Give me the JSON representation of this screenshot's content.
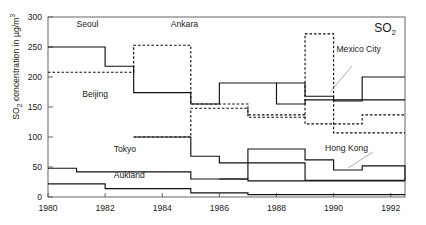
{
  "chart_data": {
    "type": "line",
    "style": "step",
    "title": "SO2",
    "title_main": "SO",
    "title_sub": "2",
    "xlabel": "",
    "ylabel": "SO2 concentration in µg/m³",
    "ylabel_main": "SO",
    "ylabel_sub": "2",
    "ylabel_rest": " concentration in µg/m",
    "ylabel_sup": "3",
    "xlim": [
      1980,
      1992.5
    ],
    "ylim": [
      0,
      300
    ],
    "yticks": [
      0,
      50,
      100,
      150,
      200,
      250,
      300
    ],
    "ytick_labels": [
      "0",
      "50",
      "100",
      "150",
      "200",
      "250",
      "300"
    ],
    "xticks": [
      1980,
      1982,
      1984,
      1986,
      1988,
      1990,
      1992
    ],
    "xtick_labels": [
      "1980",
      "1982",
      "1984",
      "1986",
      "1988",
      "1990",
      "1992"
    ],
    "grid": false,
    "legend": "inline-annotations",
    "series": [
      {
        "name": "Seoul",
        "linestyle": "solid",
        "label_x": 1981.0,
        "label_y": 283,
        "x": [
          1980,
          1982,
          1983,
          1985,
          1986,
          1987,
          1988,
          1989,
          1990,
          1991,
          1992.5
        ],
        "values": [
          250,
          218,
          174,
          155,
          190,
          190,
          155,
          162,
          162,
          162,
          162
        ]
      },
      {
        "name": "Beijing",
        "linestyle": "dashed",
        "label_x": 1981.2,
        "label_y": 166,
        "x": [
          1980,
          1982,
          1983,
          1985,
          1986,
          1987,
          1988,
          1989,
          1990,
          1991,
          1992.5
        ],
        "values": [
          208,
          208,
          253,
          155,
          155,
          137,
          137,
          122,
          122,
          137,
          137
        ]
      },
      {
        "name": "Ankara",
        "linestyle": "dashed",
        "label_x": 1984.3,
        "label_y": 283,
        "x": [
          1983,
          1984,
          1985,
          1986,
          1987,
          1988,
          1989,
          1990,
          1991,
          1992.5
        ],
        "values": [
          100,
          100,
          148,
          148,
          133,
          133,
          272,
          107,
          107,
          107
        ]
      },
      {
        "name": "Mexico City",
        "linestyle": "solid",
        "label_x": 1990.1,
        "label_y": 242,
        "x": [
          1988,
          1989,
          1990,
          1991,
          1992.5
        ],
        "values": [
          190,
          168,
          160,
          200,
          200
        ]
      },
      {
        "name": "Tokyo",
        "linestyle": "solid",
        "label_x": 1982.3,
        "label_y": 75,
        "x": [
          1983,
          1985,
          1986,
          1987,
          1988,
          1989,
          1990,
          1991,
          1992.5
        ],
        "values": [
          100,
          68,
          57,
          57,
          57,
          28,
          28,
          28,
          28
        ]
      },
      {
        "name": "Hong Kong",
        "linestyle": "solid",
        "label_x": 1989.7,
        "label_y": 77,
        "x": [
          1980,
          1981,
          1983,
          1985,
          1987,
          1988,
          1989,
          1990,
          1991,
          1992.5
        ],
        "values": [
          48,
          42,
          42,
          30,
          27,
          27,
          27,
          27,
          27,
          27
        ]
      },
      {
        "name": "Aukland",
        "linestyle": "solid",
        "label_x": 1982.3,
        "label_y": 31,
        "x": [
          1980,
          1981,
          1982,
          1984,
          1985,
          1986,
          1987,
          1989,
          1992.5
        ],
        "values": [
          22,
          22,
          14,
          14,
          7,
          7,
          4,
          4,
          4
        ]
      },
      {
        "name": "Hong Kong upper",
        "linestyle": "solid",
        "label_x": null,
        "label_y": null,
        "x": [
          1986,
          1987,
          1988,
          1989,
          1990,
          1991,
          1992.5
        ],
        "values": [
          30,
          80,
          80,
          62,
          45,
          52,
          27
        ]
      }
    ],
    "annotations": [
      {
        "text": "Seoul",
        "x": 1981.0,
        "y": 283
      },
      {
        "text": "Ankara",
        "x": 1984.3,
        "y": 283
      },
      {
        "text": "Beijing",
        "x": 1981.2,
        "y": 166
      },
      {
        "text": "Tokyo",
        "x": 1982.3,
        "y": 75
      },
      {
        "text": "Aukland",
        "x": 1982.3,
        "y": 31
      },
      {
        "text": "Mexico City",
        "x": 1990.1,
        "y": 242
      },
      {
        "text": "Hong Kong",
        "x": 1989.7,
        "y": 77
      }
    ]
  }
}
